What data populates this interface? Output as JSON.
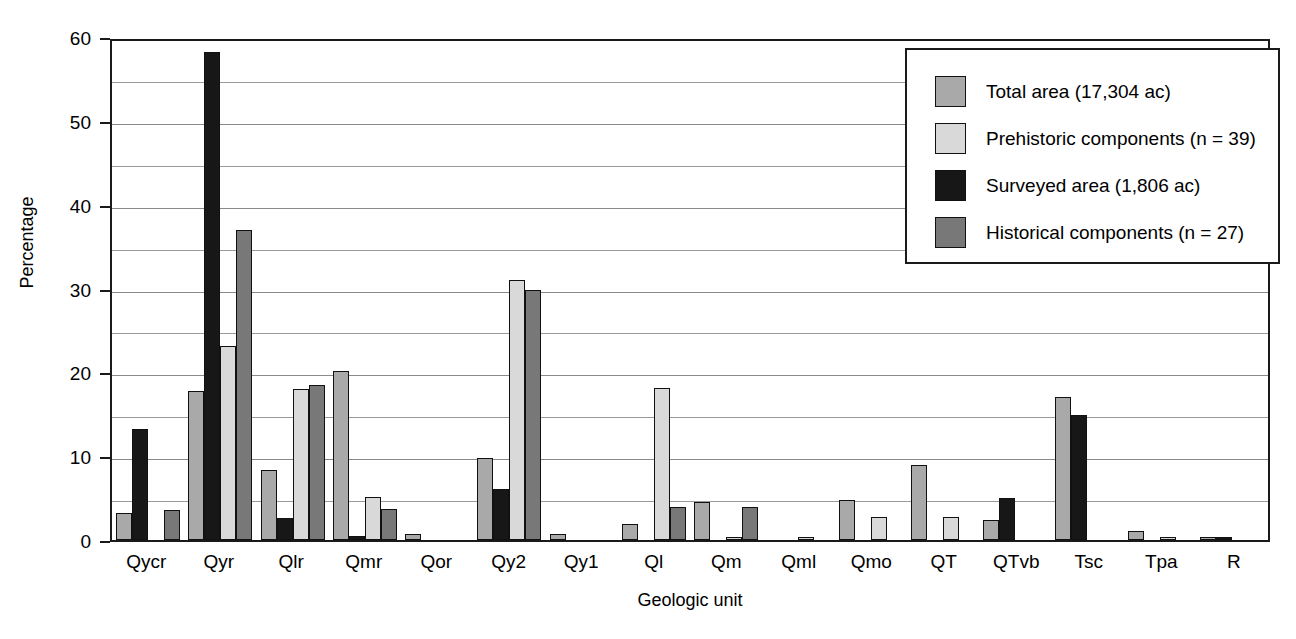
{
  "chart_data": {
    "type": "bar",
    "title": "",
    "xlabel": "Geologic unit",
    "ylabel": "Percentage",
    "ylim": [
      0,
      60
    ],
    "ytick_labels": [
      "0",
      "10",
      "20",
      "30",
      "40",
      "50",
      "60"
    ],
    "yticks": [
      0,
      10,
      20,
      30,
      40,
      50,
      60
    ],
    "minor_gridlines": [
      5,
      15,
      25,
      35,
      45,
      55
    ],
    "grid": true,
    "legend_position": "top-right",
    "categories": [
      "Qycr",
      "Qyr",
      "Qlr",
      "Qmr",
      "Qor",
      "Qy2",
      "Qy1",
      "Ql",
      "Qm",
      "Qml",
      "Qmo",
      "QT",
      "QTvb",
      "Tsc",
      "Tpa",
      "R"
    ],
    "series": [
      {
        "name": "Total area (17,304 ac)",
        "color": "#a9a9a9",
        "values": [
          3.2,
          17.8,
          8.3,
          20.2,
          0.7,
          9.8,
          0.7,
          1.9,
          4.5,
          0.0,
          4.8,
          8.9,
          2.4,
          17.0,
          1.1,
          0.2
        ]
      },
      {
        "name": "Prehistoric components (n = 39)",
        "color": "#d9d9d9",
        "values": [
          0.0,
          23.2,
          18.0,
          5.1,
          0.0,
          31.0,
          0.0,
          18.1,
          0.2,
          0.3,
          2.7,
          2.8,
          0.0,
          0.0,
          0.2,
          0.0
        ]
      },
      {
        "name": "Surveyed area (1,806 ac)",
        "color": "#171717",
        "values": [
          13.3,
          58.2,
          2.6,
          0.5,
          0.0,
          6.1,
          0.0,
          0.0,
          0.0,
          0.0,
          0.0,
          0.0,
          5.0,
          14.9,
          0.0,
          0.2
        ]
      },
      {
        "name": "Historical components (n = 27)",
        "color": "#787878",
        "values": [
          3.6,
          37.0,
          18.5,
          3.7,
          0.0,
          29.8,
          0.0,
          3.9,
          3.9,
          0.0,
          0.0,
          0.0,
          0.0,
          0.0,
          0.0,
          0.0
        ]
      }
    ],
    "draw_order": [
      0,
      2,
      1,
      3
    ]
  },
  "axes": {
    "y_title": "Percentage",
    "x_title": "Geologic unit"
  },
  "legend": {
    "items": [
      {
        "label": "Total area (17,304 ac)",
        "color": "#a9a9a9"
      },
      {
        "label": "Prehistoric components (n = 39)",
        "color": "#d9d9d9"
      },
      {
        "label": "Surveyed area (1,806 ac)",
        "color": "#171717"
      },
      {
        "label": "Historical components (n = 27)",
        "color": "#787878"
      }
    ]
  }
}
